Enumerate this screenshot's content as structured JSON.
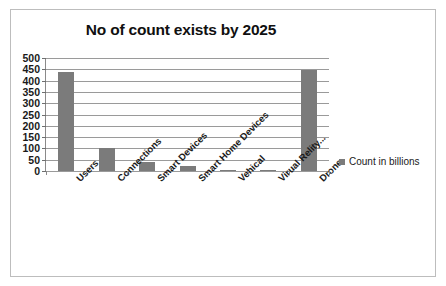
{
  "chart_data": {
    "type": "bar",
    "title": "No of count exists by 2025",
    "xlabel": "",
    "ylabel": "",
    "ylim": [
      0,
      500
    ],
    "ytick_step": 50,
    "yticks": [
      "500",
      "450",
      "400",
      "350",
      "300",
      "250",
      "200",
      "150",
      "100",
      "50",
      "0"
    ],
    "grid": true,
    "legend_position": "right",
    "categories": [
      "Users",
      "Connections",
      "Smart Devices",
      "Smart Home Devices",
      "Vehical",
      "Virual Relity...",
      "Drone"
    ],
    "series": [
      {
        "name": "Count in billions",
        "color": "#7b7b7b",
        "values": [
          440,
          100,
          40,
          20,
          3,
          3,
          445
        ]
      }
    ]
  },
  "legend": {
    "label": "Count in billions",
    "swatch_color": "#7b7b7b",
    "marker_icon": "square-marker-icon"
  },
  "frame": {
    "border_color": "#bdbdbd",
    "background": "#ffffff"
  }
}
